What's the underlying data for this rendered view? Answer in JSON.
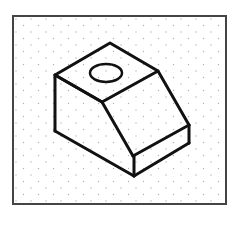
{
  "diagram": {
    "type": "isometric-drawing",
    "background": "#ffffff",
    "grid": {
      "style": "isometric-dot-grid",
      "dot_color": "#b0b0b0",
      "spacing": 7.5
    },
    "frame": {
      "x": 13,
      "y": 16,
      "width": 213,
      "height": 188,
      "stroke": "#444444",
      "stroke_width": 2
    },
    "line_color": "#111111",
    "line_width": 3,
    "hole": {
      "shape": "ellipse",
      "cx": 106,
      "cy": 73,
      "rx": 16,
      "ry": 9
    }
  }
}
